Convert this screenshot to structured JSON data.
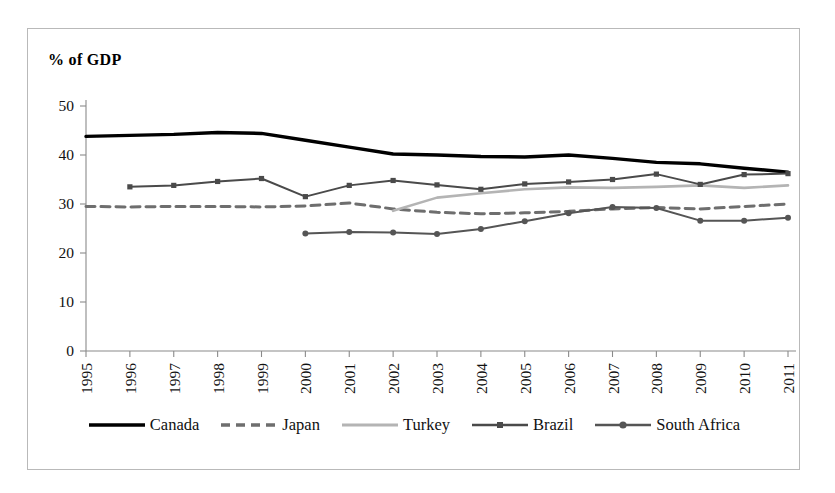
{
  "chart_data": {
    "type": "line",
    "title": "",
    "ylabel": "% of GDP",
    "xlabel": "",
    "ylim": [
      0,
      50
    ],
    "yticks": [
      0,
      10,
      20,
      30,
      40,
      50
    ],
    "grid": false,
    "legend_position": "bottom",
    "categories": [
      "1995",
      "1996",
      "1997",
      "1998",
      "1999",
      "2000",
      "2001",
      "2002",
      "2003",
      "2004",
      "2005",
      "2006",
      "2007",
      "2008",
      "2009",
      "2010",
      "2011"
    ],
    "series": [
      {
        "name": "Canada",
        "style": "solid-black-thick",
        "color": "#000000",
        "values": [
          43.8,
          44.0,
          44.2,
          44.6,
          44.4,
          43.0,
          41.6,
          40.2,
          40.0,
          39.7,
          39.6,
          40.0,
          39.3,
          38.5,
          38.2,
          37.3,
          36.5
        ]
      },
      {
        "name": "Japan",
        "style": "dashed-gray",
        "color": "#6e6e6e",
        "values": [
          29.5,
          29.4,
          29.5,
          29.5,
          29.4,
          29.6,
          30.2,
          29.0,
          28.3,
          28.0,
          28.2,
          28.5,
          29.0,
          29.3,
          29.0,
          29.5,
          30.0
        ]
      },
      {
        "name": "Turkey",
        "style": "solid-light-gray",
        "color": "#b4b4b4",
        "values": [
          null,
          null,
          null,
          null,
          null,
          null,
          null,
          28.6,
          31.3,
          32.2,
          33.0,
          33.4,
          33.3,
          33.5,
          33.8,
          33.3,
          33.8
        ]
      },
      {
        "name": "Brazil",
        "style": "solid-gray-square-marker",
        "color": "#4a4a4a",
        "values": [
          null,
          33.5,
          33.8,
          34.6,
          35.2,
          31.5,
          33.8,
          34.8,
          33.9,
          33.0,
          34.1,
          34.5,
          35.0,
          36.1,
          34.0,
          36.0,
          36.2
        ]
      },
      {
        "name": "South Africa",
        "style": "solid-gray-round-marker",
        "color": "#555555",
        "values": [
          null,
          null,
          null,
          null,
          null,
          24.0,
          24.3,
          24.2,
          23.9,
          24.9,
          26.5,
          28.1,
          29.4,
          29.2,
          26.6,
          26.6,
          27.2
        ]
      }
    ]
  },
  "legend": {
    "items": [
      {
        "label": "Canada"
      },
      {
        "label": "Japan"
      },
      {
        "label": "Turkey"
      },
      {
        "label": "Brazil"
      },
      {
        "label": "South Africa"
      }
    ]
  },
  "axes": {
    "y_title": "% of GDP",
    "y_ticks": [
      "50",
      "40",
      "30",
      "20",
      "10",
      "0"
    ],
    "x_ticks": [
      "1995",
      "1996",
      "1997",
      "1998",
      "1999",
      "2000",
      "2001",
      "2002",
      "2003",
      "2004",
      "2005",
      "2006",
      "2007",
      "2008",
      "2009",
      "2010",
      "2011"
    ]
  },
  "colors": {
    "canada": "#000000",
    "japan": "#6e6e6e",
    "turkey": "#b4b4b4",
    "brazil": "#4a4a4a",
    "south_africa": "#555555",
    "axis": "#8a8a8a",
    "border": "#b9b9b9"
  }
}
